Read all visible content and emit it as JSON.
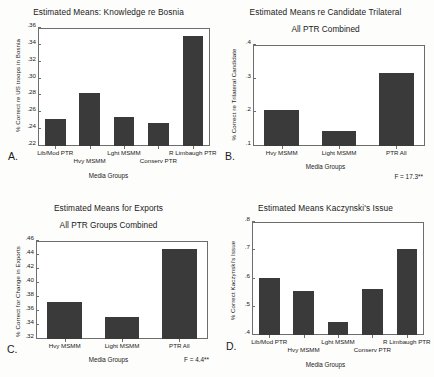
{
  "figure": {
    "panels": [
      {
        "letter": "A.",
        "title": "Estimated Means: Knowledge re Bosnia",
        "subtitle": "",
        "ylabel": "% Correct re US troops in Bosnia",
        "xlabel": "Media Groups",
        "fstat": "",
        "chart_data": {
          "type": "bar",
          "title": "Estimated Means: Knowledge re Bosnia",
          "xlabel": "Media Groups",
          "ylabel": "% Correct re US troops in Bosnia",
          "categories": [
            "Lib/Mod PTR",
            "Hvy MSMM",
            "Lght MSMM",
            "Conserv PTR",
            "R Limbaugh PTR"
          ],
          "values": [
            0.252,
            0.283,
            0.254,
            0.247,
            0.351
          ],
          "ylim": [
            0.22,
            0.36
          ],
          "yticks": [
            0.22,
            0.24,
            0.26,
            0.28,
            0.3,
            0.32,
            0.34,
            0.36
          ],
          "yticklabels": [
            ".22",
            ".24",
            ".26",
            ".28",
            ".30",
            ".32",
            ".34",
            ".36"
          ],
          "grid": false,
          "legend": false
        }
      },
      {
        "letter": "B.",
        "title": "Estimated Means re Candidate Trilateral",
        "subtitle": "All PTR Combined",
        "ylabel": "% Correct re Trilateral Candidate",
        "xlabel": "Media Groups",
        "fstat": "F = 17.3**",
        "chart_data": {
          "type": "bar",
          "title": "Estimated Means re Candidate Trilateral",
          "subtitle": "All PTR Combined",
          "xlabel": "Media Groups",
          "ylabel": "% Correct re Trilateral Candidate",
          "categories": [
            "Hvy MSMM",
            "Light MSMM",
            "PTR All"
          ],
          "values": [
            0.208,
            0.145,
            0.317
          ],
          "ylim": [
            0.1,
            0.4
          ],
          "yticks": [
            0.1,
            0.2,
            0.3,
            0.4
          ],
          "yticklabels": [
            ".1",
            ".2",
            ".3",
            ".4"
          ],
          "grid": false,
          "legend": false,
          "annotation": "F = 17.3**"
        }
      },
      {
        "letter": "C.",
        "title": "Estimated Means for Exports",
        "subtitle": "All PTR Groups Combined",
        "ylabel": "% Correct for Change in Exports",
        "xlabel": "Media Groups",
        "fstat": "F = 4.4**",
        "chart_data": {
          "type": "bar",
          "title": "Estimated Means for Exports",
          "subtitle": "All PTR Groups Combined",
          "xlabel": "Media Groups",
          "ylabel": "% Correct for Change in Exports",
          "categories": [
            "Hvy MSMM",
            "Light MSMM",
            "PTR All"
          ],
          "values": [
            0.373,
            0.352,
            0.449
          ],
          "ylim": [
            0.32,
            0.46
          ],
          "yticks": [
            0.32,
            0.34,
            0.36,
            0.38,
            0.4,
            0.42,
            0.44,
            0.46
          ],
          "yticklabels": [
            ".32",
            ".34",
            ".36",
            ".38",
            ".40",
            ".42",
            ".44",
            ".46"
          ],
          "grid": false,
          "legend": false,
          "annotation": "F = 4.4**"
        }
      },
      {
        "letter": "D.",
        "title": "Estimated Means Kaczynski's Issue",
        "subtitle": "",
        "ylabel": "% Correct Kaczynski's Issue",
        "xlabel": "Media Groups",
        "fstat": "",
        "chart_data": {
          "type": "bar",
          "title": "Estimated Means Kaczynski's Issue",
          "xlabel": "Media Groups",
          "ylabel": "% Correct Kaczynski's Issue",
          "categories": [
            "Lib/Mod PTR",
            "Hvy MSMM",
            "Lght MSMM",
            "Conserv PTR",
            "R Limbaugh PTR"
          ],
          "values": [
            0.602,
            0.556,
            0.445,
            0.562,
            0.705
          ],
          "ylim": [
            0.4,
            0.8
          ],
          "yticks": [
            0.4,
            0.5,
            0.6,
            0.7,
            0.8
          ],
          "yticklabels": [
            ".4",
            ".5",
            ".6",
            ".7",
            ".8"
          ],
          "grid": false,
          "legend": false
        }
      }
    ]
  },
  "chart_data": [
    {
      "type": "bar",
      "title": "Estimated Means: Knowledge re Bosnia",
      "xlabel": "Media Groups",
      "ylabel": "% Correct re US troops in Bosnia",
      "categories": [
        "Lib/Mod PTR",
        "Hvy MSMM",
        "Lght MSMM",
        "Conserv PTR",
        "R Limbaugh PTR"
      ],
      "values": [
        0.252,
        0.283,
        0.254,
        0.247,
        0.351
      ],
      "ylim": [
        0.22,
        0.36
      ]
    },
    {
      "type": "bar",
      "title": "Estimated Means re Candidate Trilateral",
      "subtitle": "All PTR Combined",
      "xlabel": "Media Groups",
      "ylabel": "% Correct re Trilateral Candidate",
      "categories": [
        "Hvy MSMM",
        "Light MSMM",
        "PTR All"
      ],
      "values": [
        0.208,
        0.145,
        0.317
      ],
      "ylim": [
        0.1,
        0.4
      ],
      "annotation": "F = 17.3**"
    },
    {
      "type": "bar",
      "title": "Estimated Means for Exports",
      "subtitle": "All PTR Groups Combined",
      "xlabel": "Media Groups",
      "ylabel": "% Correct for Change in Exports",
      "categories": [
        "Hvy MSMM",
        "Light MSMM",
        "PTR All"
      ],
      "values": [
        0.373,
        0.352,
        0.449
      ],
      "ylim": [
        0.32,
        0.46
      ],
      "annotation": "F = 4.4**"
    },
    {
      "type": "bar",
      "title": "Estimated Means Kaczynski's Issue",
      "xlabel": "Media Groups",
      "ylabel": "% Correct Kaczynski's Issue",
      "categories": [
        "Lib/Mod PTR",
        "Hvy MSMM",
        "Lght MSMM",
        "Conserv PTR",
        "R Limbaugh PTR"
      ],
      "values": [
        0.602,
        0.556,
        0.445,
        0.562,
        0.705
      ],
      "ylim": [
        0.4,
        0.8
      ]
    }
  ],
  "style": {
    "bar_color": "#3a3a3a",
    "axis_color": "#6d6d6d",
    "background": "#fdfdfc"
  }
}
